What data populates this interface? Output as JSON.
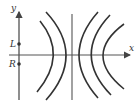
{
  "diagram": {
    "axes": {
      "x_label": "x",
      "y_label": "y"
    },
    "points": [
      {
        "label": "L",
        "x": 19,
        "y": 44
      },
      {
        "label": "R",
        "x": 19,
        "y": 64
      }
    ],
    "colors": {
      "stroke": "#333333",
      "axis": "#555555",
      "background": "#ffffff"
    }
  }
}
